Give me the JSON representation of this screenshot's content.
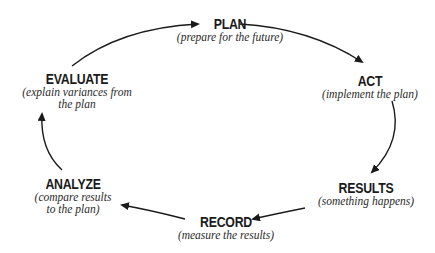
{
  "diagram": {
    "type": "cycle",
    "direction": "clockwise",
    "nodes": [
      {
        "id": "plan",
        "title": "PLAN",
        "subtitle": "(prepare for the future)"
      },
      {
        "id": "act",
        "title": "ACT",
        "subtitle": "(implement the plan)"
      },
      {
        "id": "results",
        "title": "RESULTS",
        "subtitle": "(something happens)"
      },
      {
        "id": "record",
        "title": "RECORD",
        "subtitle": "(measure the results)"
      },
      {
        "id": "analyze",
        "title": "ANALYZE",
        "subtitle_line1": "(compare results",
        "subtitle_line2": "to the plan)"
      },
      {
        "id": "evaluate",
        "title": "EVALUATE",
        "subtitle_line1": "(explain variances from",
        "subtitle_line2": "the plan"
      }
    ],
    "edges": [
      {
        "from": "evaluate",
        "to": "plan"
      },
      {
        "from": "plan",
        "to": "act"
      },
      {
        "from": "act",
        "to": "results"
      },
      {
        "from": "results",
        "to": "record"
      },
      {
        "from": "record",
        "to": "analyze"
      },
      {
        "from": "analyze",
        "to": "evaluate"
      }
    ],
    "colors": {
      "ink": "#1a1a1a",
      "background": "#ffffff"
    }
  }
}
